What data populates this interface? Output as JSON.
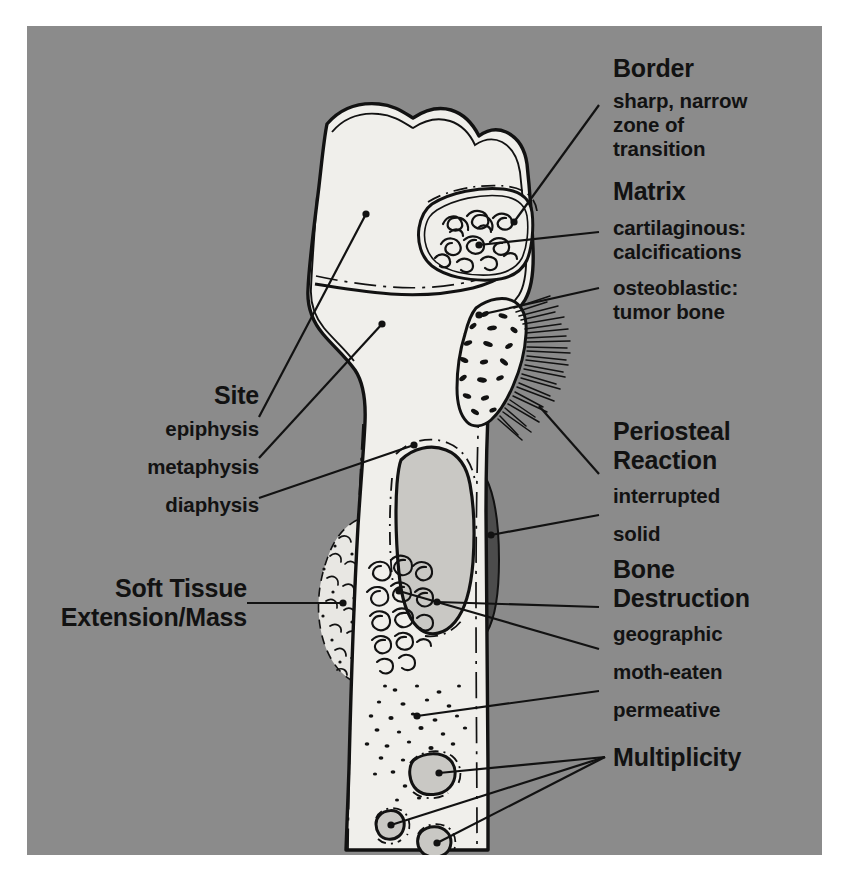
{
  "figure": {
    "panel_background": "#8b8b8b",
    "page_background": "#ffffff",
    "bone_fill": "#f0efeb",
    "lesion_fill": "#c9c8c4",
    "ink": "#121212"
  },
  "labels": {
    "border": {
      "heading": "Border",
      "detail_line1": "sharp, narrow",
      "detail_line2": "zone of",
      "detail_line3": "transition"
    },
    "matrix": {
      "heading": "Matrix",
      "item1_line1": "cartilaginous:",
      "item1_line2": "calcifications",
      "item2_line1": "osteoblastic:",
      "item2_line2": "tumor bone"
    },
    "periosteal": {
      "heading_line1": "Periosteal",
      "heading_line2": "Reaction",
      "item1": "interrupted",
      "item2": "solid"
    },
    "destruction": {
      "heading_line1": "Bone",
      "heading_line2": "Destruction",
      "item1": "geographic",
      "item2": "moth-eaten",
      "item3": "permeative"
    },
    "multiplicity": {
      "heading": "Multiplicity"
    },
    "site": {
      "heading": "Site",
      "item1": "epiphysis",
      "item2": "metaphysis",
      "item3": "diaphysis"
    },
    "soft_tissue": {
      "heading_line1": "Soft Tissue",
      "heading_line2": "Extension/Mass"
    }
  },
  "anatomy": {
    "bone_name": "long-bone-proximal-end",
    "regions": [
      "epiphysis",
      "metaphysis",
      "diaphysis"
    ],
    "findings": [
      "sharp narrow zone of transition",
      "cartilaginous matrix with calcifications",
      "osteoblastic matrix with tumor bone",
      "interrupted periosteal reaction",
      "solid periosteal reaction",
      "geographic bone destruction",
      "moth-eaten bone destruction",
      "permeative bone destruction",
      "soft tissue extension/mass",
      "multiplicity of lesions"
    ]
  }
}
